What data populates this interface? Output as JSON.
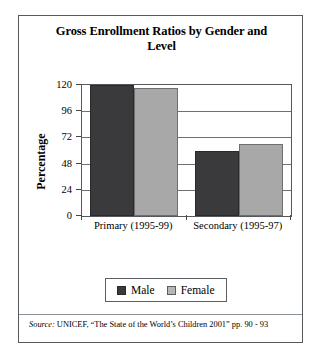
{
  "chart_data": {
    "type": "bar",
    "title": "Gross Enrollment Ratios by Gender and Level",
    "xlabel": "",
    "ylabel": "Percentage",
    "categories": [
      "Primary (1995-99)",
      "Secondary (1995-97)"
    ],
    "series": [
      {
        "name": "Male",
        "color": "#3a3a3c",
        "values": [
          120,
          60
        ]
      },
      {
        "name": "Female",
        "color": "#a8a8a8",
        "values": [
          117,
          66
        ]
      }
    ],
    "ylim": [
      0,
      120
    ],
    "yticks": [
      0,
      24,
      48,
      72,
      96,
      120
    ],
    "ytick_labels": [
      "0",
      "24",
      "48",
      "72",
      "96",
      "120"
    ],
    "grid": true,
    "legend_position": "bottom"
  },
  "title": {
    "line1": "Gross Enrollment Ratios by Gender and",
    "line2": "Level",
    "full": "Gross Enrollment Ratios by Gender and Level"
  },
  "axes": {
    "y_title": "Percentage",
    "y_ticks": [
      "120",
      "96",
      "72",
      "48",
      "24",
      "0"
    ],
    "x_categories": [
      "Primary (1995-99)",
      "Secondary (1995-97)"
    ]
  },
  "legend": {
    "items": [
      {
        "label": "Male",
        "swatch": "dark-gray-swatch"
      },
      {
        "label": "Female",
        "swatch": "light-gray-swatch"
      }
    ]
  },
  "source": {
    "lead": "Source:",
    "text": " UNICEF, “The State of the World’s Children 2001” pp. 90 - 93",
    "full": "Source: UNICEF, “The State of the World’s Children 2001” pp. 90 - 93"
  },
  "colors": {
    "male_bar": "#3a3a3c",
    "female_bar": "#a8a8a8",
    "frame": "#555a5e",
    "gridline": "#6d7074",
    "background": "#ffffff"
  }
}
